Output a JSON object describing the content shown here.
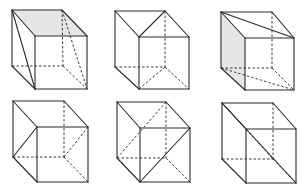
{
  "figure": {
    "title": "",
    "colors": {
      "line": "#2a2a2a",
      "dashed": "#3a3a3a",
      "shade": "#e6e6e6",
      "background": "#ffffff"
    },
    "cubes": [
      {
        "id": "cube-1",
        "row": 1,
        "col": 1,
        "vertices": {
          "BTL": [
            12,
            10
          ],
          "BTR": [
            62,
            10
          ],
          "FTL": [
            35,
            36
          ],
          "FTR": [
            87,
            36
          ],
          "FBL": [
            35,
            89
          ],
          "FBR": [
            87,
            89
          ],
          "BBL": [
            12,
            66
          ],
          "BBR": [
            63,
            66
          ]
        },
        "shaded_face": "top",
        "solid_extra": [
          [
            "BTL",
            "FBL"
          ]
        ],
        "dashed_extra": [
          [
            "BTR",
            "FBR"
          ]
        ]
      },
      {
        "id": "cube-2",
        "row": 1,
        "col": 2,
        "vertices": {
          "BTL": [
            115,
            11
          ],
          "BTR": [
            165,
            11
          ],
          "FTL": [
            139,
            37
          ],
          "FTR": [
            189,
            37
          ],
          "FBL": [
            139,
            89
          ],
          "FBR": [
            189,
            89
          ],
          "BBL": [
            115,
            67
          ],
          "BBR": [
            165,
            67
          ]
        },
        "shaded_face": "",
        "solid_extra": [
          [
            "BTR",
            "FTL"
          ]
        ],
        "dashed_extra": [
          [
            "BBR",
            "FBL"
          ]
        ]
      },
      {
        "id": "cube-3",
        "row": 1,
        "col": 3,
        "vertices": {
          "BTL": [
            221,
            12
          ],
          "BTR": [
            272,
            12
          ],
          "FTL": [
            245,
            38
          ],
          "FTR": [
            294,
            38
          ],
          "FBL": [
            245,
            90
          ],
          "FBR": [
            294,
            90
          ],
          "BBL": [
            221,
            68
          ],
          "BBR": [
            272,
            68
          ]
        },
        "shaded_face": "left",
        "solid_extra": [
          [
            "BTL",
            "FTR"
          ]
        ],
        "dashed_extra": [
          [
            "BBL",
            "FBR"
          ]
        ]
      },
      {
        "id": "cube-4",
        "row": 2,
        "col": 1,
        "vertices": {
          "BTL": [
            13,
            101
          ],
          "BTR": [
            64,
            101
          ],
          "FTL": [
            37,
            127
          ],
          "FTR": [
            88,
            127
          ],
          "FBL": [
            37,
            182
          ],
          "FBR": [
            88,
            182
          ],
          "BBL": [
            13,
            157
          ],
          "BBR": [
            64,
            157
          ]
        },
        "shaded_face": "",
        "solid_extra": [
          [
            "BBL",
            "FTL"
          ]
        ],
        "dashed_extra": [
          [
            "BBR",
            "FTR"
          ]
        ]
      },
      {
        "id": "cube-5",
        "row": 2,
        "col": 2,
        "vertices": {
          "BTL": [
            117,
            102
          ],
          "BTR": [
            166,
            102
          ],
          "FTL": [
            140,
            128
          ],
          "FTR": [
            190,
            128
          ],
          "FBL": [
            140,
            182
          ],
          "FBR": [
            190,
            182
          ],
          "BBL": [
            117,
            158
          ],
          "BBR": [
            166,
            158
          ]
        },
        "shaded_face": "",
        "solid_extra": [
          [
            "FBL",
            "FTR"
          ]
        ],
        "dashed_extra": [
          [
            "BBL",
            "BTR"
          ]
        ]
      },
      {
        "id": "cube-6",
        "row": 2,
        "col": 3,
        "vertices": {
          "BTL": [
            222,
            103
          ],
          "BTR": [
            273,
            103
          ],
          "FTL": [
            246,
            129
          ],
          "FTR": [
            296,
            129
          ],
          "FBL": [
            246,
            183
          ],
          "FBR": [
            296,
            183
          ],
          "BBL": [
            222,
            159
          ],
          "BBR": [
            273,
            159
          ]
        },
        "shaded_face": "",
        "solid_extra": [
          [
            "BTL",
            "FBR"
          ]
        ],
        "dashed_extra": [
          [
            "BTL",
            "BBR"
          ]
        ]
      }
    ]
  }
}
